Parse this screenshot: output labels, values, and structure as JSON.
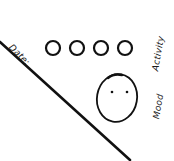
{
  "labels": {
    "date": "Date:",
    "activity": "Activity",
    "mood": "Mood"
  },
  "activity_circles": {
    "count": 4,
    "filled": 0
  },
  "mood_face": {
    "eyes": 2,
    "mouth": "none"
  },
  "colors": {
    "ink": "#1a1a1a",
    "background": "#ffffff"
  }
}
